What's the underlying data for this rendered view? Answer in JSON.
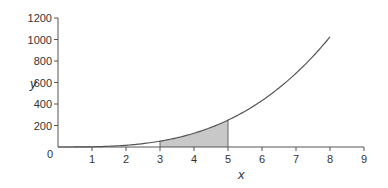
{
  "chart_data": {
    "type": "line",
    "title": "",
    "xlabel": "x",
    "ylabel": "y",
    "function": "y = 2x^3",
    "x": [
      0,
      1,
      2,
      3,
      4,
      5,
      6,
      7,
      8
    ],
    "series": [
      {
        "name": "y = 2x^3",
        "values": [
          0,
          2,
          16,
          54,
          128,
          250,
          432,
          686,
          1024
        ]
      }
    ],
    "shaded_region": {
      "x_from": 3,
      "x_to": 5,
      "color": "#c8c8c8",
      "description": "area under curve from x=3 to x=5"
    },
    "xlim": [
      0,
      9
    ],
    "ylim": [
      0,
      1200
    ],
    "x_ticks": [
      "0",
      "1",
      "2",
      "3",
      "4",
      "5",
      "6",
      "7",
      "8",
      "9"
    ],
    "y_ticks": [
      "200",
      "400",
      "600",
      "800",
      "1000",
      "1200"
    ],
    "grid": false,
    "legend": "none",
    "colors": {
      "curve": "#555555",
      "shade": "#c8c8c8",
      "axis": "#555555"
    }
  },
  "labels": {
    "xlabel": "x",
    "ylabel": "y",
    "origin": "0"
  }
}
